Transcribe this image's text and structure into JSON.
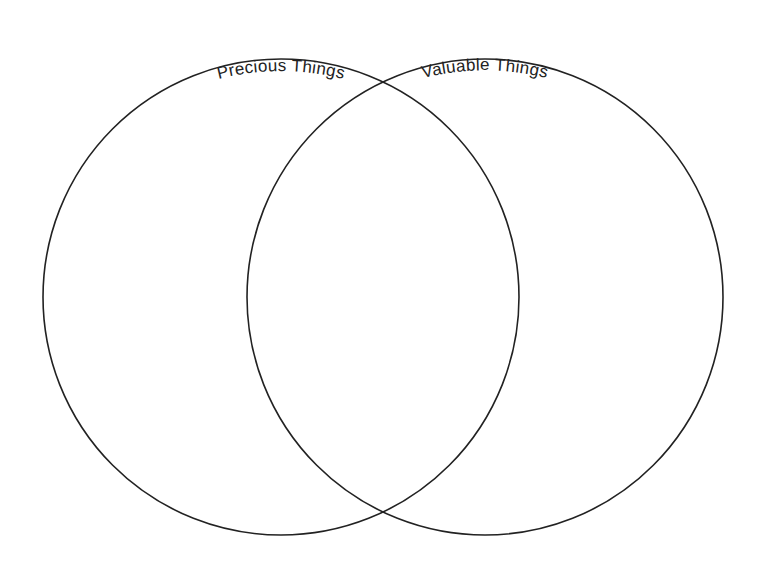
{
  "diagram": {
    "type": "venn",
    "sets": [
      {
        "label": "Precious Things",
        "cx": 281,
        "cy": 297,
        "r": 238
      },
      {
        "label": "Valuable Things",
        "cx": 485,
        "cy": 297,
        "r": 238
      }
    ],
    "colors": {
      "stroke": "#222222",
      "text": "#222222",
      "background": "#ffffff"
    }
  }
}
